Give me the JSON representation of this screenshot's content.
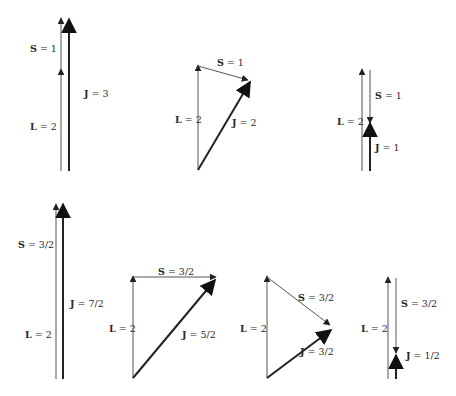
{
  "colors": {
    "thin_line": "#555555",
    "thick_line": "#222222",
    "text": "#2a2a2a",
    "background": "#ffffff"
  },
  "panels": [
    {
      "id": "L2-S1-J3",
      "labels": {
        "S": {
          "sym": "S",
          "val": " = 1"
        },
        "L": {
          "sym": "L",
          "val": " = 2"
        },
        "J": {
          "sym": "J",
          "val": " = 3"
        }
      }
    },
    {
      "id": "L2-S1-J2",
      "labels": {
        "S": {
          "sym": "S",
          "val": " = 1"
        },
        "L": {
          "sym": "L",
          "val": " = 2"
        },
        "J": {
          "sym": "J",
          "val": " = 2"
        }
      }
    },
    {
      "id": "L2-S1-J1",
      "labels": {
        "S": {
          "sym": "S",
          "val": " = 1"
        },
        "L": {
          "sym": "L",
          "val": " = 2"
        },
        "J": {
          "sym": "J",
          "val": " = 1"
        }
      }
    },
    {
      "id": "L2-S3/2-J7/2",
      "labels": {
        "S": {
          "sym": "S",
          "val": " = 3/2"
        },
        "L": {
          "sym": "L",
          "val": " = 2"
        },
        "J": {
          "sym": "J",
          "val": " = 7/2"
        }
      }
    },
    {
      "id": "L2-S3/2-J5/2",
      "labels": {
        "S": {
          "sym": "S",
          "val": " = 3/2"
        },
        "L": {
          "sym": "L",
          "val": " = 2"
        },
        "J": {
          "sym": "J",
          "val": " = 5/2"
        }
      }
    },
    {
      "id": "L2-S3/2-J3/2",
      "labels": {
        "S": {
          "sym": "S",
          "val": " = 3/2"
        },
        "L": {
          "sym": "L",
          "val": " = 2"
        },
        "J": {
          "sym": "J",
          "val": " = 3/2"
        }
      }
    },
    {
      "id": "L2-S3/2-J1/2",
      "labels": {
        "S": {
          "sym": "S",
          "val": " = 3/2"
        },
        "L": {
          "sym": "L",
          "val": " = 2"
        },
        "J": {
          "sym": "J",
          "val": " = 1/2"
        }
      }
    }
  ]
}
